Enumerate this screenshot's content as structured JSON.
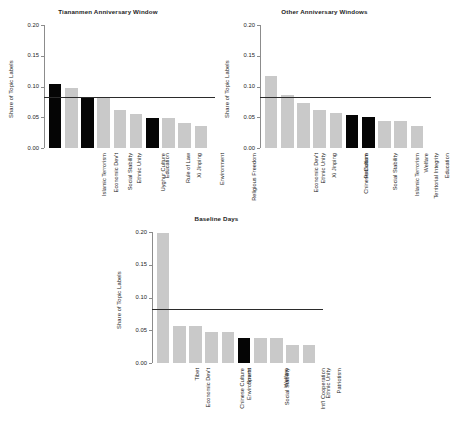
{
  "figure": {
    "ylabel": "Share of Topic Labels",
    "ytick_labels": [
      "0.20",
      "0.15",
      "0.10",
      "0.05",
      "0.00"
    ],
    "colors": {
      "highlight": "#050505",
      "normal": "#c9c9c9",
      "refline": "#2b2b2b",
      "axis": "#8c8c8c",
      "background": "#ffffff"
    }
  },
  "chart_data": [
    {
      "type": "bar",
      "id": "tiananmen-anniversary-window",
      "title": "Tiananmen Anniversary Window",
      "xlabel": "",
      "ylabel": "Share of Topic Labels",
      "ylim": [
        0.0,
        0.2
      ],
      "yticks": [
        0.0,
        0.05,
        0.1,
        0.15,
        0.2
      ],
      "grid": false,
      "legend": "none",
      "reference_line": 0.083,
      "categories": [
        "Islamic Terrorism",
        "Economic Dev't",
        "Social Stability",
        "Ethnic Unity",
        "Uyghur Culture",
        "Education",
        "Rule of Law",
        "Xi Jinping",
        "Environment",
        "Religious Freedom"
      ],
      "values": [
        0.104,
        0.097,
        0.083,
        0.083,
        0.062,
        0.056,
        0.049,
        0.048,
        0.041,
        0.035
      ],
      "highlighted": [
        true,
        false,
        true,
        false,
        false,
        false,
        true,
        false,
        false,
        false
      ]
    },
    {
      "type": "bar",
      "id": "other-anniversary-windows",
      "title": "Other Anniversary Windows",
      "xlabel": "",
      "ylabel": "Share of Topic Labels",
      "ylim": [
        0.0,
        0.2
      ],
      "yticks": [
        0.0,
        0.05,
        0.1,
        0.15,
        0.2
      ],
      "grid": false,
      "legend": "none",
      "reference_line": 0.083,
      "categories": [
        "Economic Dev't",
        "Ethnic Unity",
        "Xi Jinping",
        "Chinese Culture",
        "Patriotism",
        "Social Stability",
        "Islamic Terrorism",
        "Territorial Integrity",
        "Welfare",
        "Education"
      ],
      "values": [
        0.117,
        0.087,
        0.074,
        0.062,
        0.057,
        0.054,
        0.051,
        0.044,
        0.044,
        0.035
      ],
      "highlighted": [
        false,
        false,
        false,
        false,
        false,
        true,
        true,
        false,
        false,
        false
      ]
    },
    {
      "type": "bar",
      "id": "baseline-days",
      "title": "Baseline Days",
      "xlabel": "",
      "ylabel": "Share of Topic Labels",
      "ylim": [
        0.0,
        0.2
      ],
      "yticks": [
        0.0,
        0.05,
        0.1,
        0.15,
        0.2
      ],
      "grid": false,
      "legend": "none",
      "reference_line": 0.083,
      "categories": [
        "Economic Dev't",
        "Tibet",
        "Chinese Culture",
        "Environment",
        "Sports",
        "Social Stability",
        "Welfare",
        "Int'l Cooperation",
        "Ethnic Unity",
        "Patriotism"
      ],
      "values": [
        0.198,
        0.057,
        0.057,
        0.047,
        0.047,
        0.038,
        0.038,
        0.038,
        0.028,
        0.028
      ],
      "highlighted": [
        false,
        false,
        false,
        false,
        false,
        true,
        false,
        false,
        false,
        false
      ]
    }
  ]
}
